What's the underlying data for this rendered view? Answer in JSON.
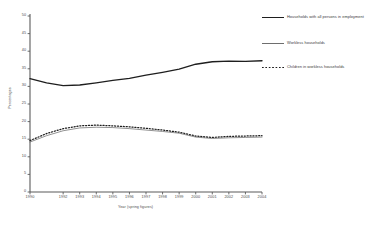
{
  "chart_data": {
    "type": "line",
    "title": "",
    "xlabel": "Year (spring figures)",
    "ylabel": "Percentages",
    "grid": false,
    "legend_position": "right",
    "ylim": [
      0,
      50
    ],
    "yticks": [
      0,
      5,
      10,
      15,
      20,
      25,
      30,
      35,
      40,
      45,
      50
    ],
    "ytick_labels": [
      "0",
      "5",
      "10",
      "15",
      "20",
      "25",
      "30",
      "35",
      "40",
      "45",
      "50"
    ],
    "x": [
      1990,
      1991,
      1992,
      1993,
      1994,
      1995,
      1996,
      1997,
      1998,
      1999,
      2000,
      2001,
      2002,
      2003,
      2004
    ],
    "xticks": [
      1990,
      1992,
      1993,
      1994,
      1995,
      1996,
      1997,
      1998,
      1999,
      2000,
      2001,
      2002,
      2003,
      2004
    ],
    "xtick_labels": [
      "1990",
      "1992",
      "1993",
      "1994",
      "1995",
      "1996",
      "1997",
      "1998",
      "1999",
      "2000",
      "2001",
      "2002",
      "2003",
      "2004"
    ],
    "series": [
      {
        "name": "Households with all persons in employment",
        "style": "solid-thick",
        "color": "#1e1e1e",
        "values": [
          32.2,
          31.0,
          30.2,
          30.4,
          31.0,
          31.7,
          32.3,
          33.2,
          34.0,
          34.9,
          36.3,
          37.0,
          37.2,
          37.1,
          37.3
        ]
      },
      {
        "name": "Workless households",
        "style": "solid-thin",
        "color": "#6e6e6e",
        "values": [
          14.2,
          16.0,
          17.4,
          18.2,
          18.4,
          18.3,
          18.0,
          17.6,
          17.2,
          16.7,
          15.6,
          15.2,
          15.4,
          15.5,
          15.6
        ]
      },
      {
        "name": "Children in workless households",
        "style": "dotted",
        "color": "#1e1e1e",
        "values": [
          14.6,
          16.6,
          18.0,
          18.8,
          19.0,
          18.8,
          18.5,
          18.1,
          17.6,
          17.0,
          15.9,
          15.5,
          15.8,
          15.9,
          16.0
        ]
      }
    ]
  },
  "legend": {
    "items": [
      {
        "label": "Households with all persons in employment",
        "swatch": "solid-thick"
      },
      {
        "label": "Workless households",
        "swatch": "solid-thin"
      },
      {
        "label": "Children in workless households",
        "swatch": "dotted"
      }
    ]
  },
  "axes": {
    "y_title": "Percentages",
    "x_title": "Year (spring figures)"
  }
}
